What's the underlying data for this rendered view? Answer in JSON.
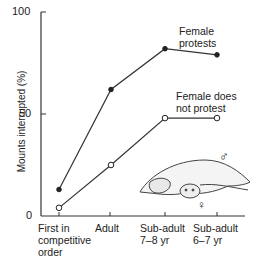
{
  "chart_data": {
    "type": "line",
    "title": "",
    "xlabel": "",
    "ylabel": "Mounts interrupted (%)",
    "ylim": [
      0,
      100
    ],
    "yticks": [
      0,
      50,
      100
    ],
    "categories": [
      "First in competitive order",
      "Adult",
      "Sub-adult 7–8 yr",
      "Sub-adult 6–7 yr"
    ],
    "series": [
      {
        "name": "Female protests",
        "marker": "filled-circle",
        "values": [
          13,
          62,
          82,
          79
        ]
      },
      {
        "name": "Female does not protest",
        "marker": "open-circle",
        "values": [
          4,
          25,
          48,
          48
        ]
      }
    ],
    "grid": false,
    "legend": "inline labels near line ends",
    "annotations": [
      "male symbol ♂",
      "female symbol ♀",
      "illustration of elephant seals mating"
    ]
  },
  "axis": {
    "y_label": "Mounts interrupted (%)",
    "y_ticks": [
      "100",
      "50",
      "0"
    ],
    "x_ticks": [
      {
        "line1": "First in",
        "line2": "competitive",
        "line3": "order"
      },
      {
        "line1": "Adult",
        "line2": "",
        "line3": ""
      },
      {
        "line1": "Sub-adult",
        "line2": "7–8 yr",
        "line3": ""
      },
      {
        "line1": "Sub-adult",
        "line2": "6–7 yr",
        "line3": ""
      }
    ]
  },
  "labels": {
    "protests_1": "Female",
    "protests_2": "protests",
    "noprotest_1": "Female does",
    "noprotest_2": "not protest",
    "male": "♂",
    "female": "♀"
  }
}
